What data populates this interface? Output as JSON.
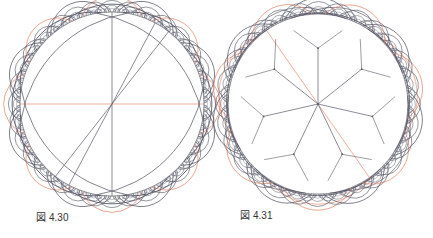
{
  "colors": {
    "background": "#ffffff",
    "geodesic": "#5a5a6a",
    "highlight": "#e98b6e",
    "boundary": "#9a9aa2",
    "caption": "#333333"
  },
  "figures": [
    {
      "id": "fig-4-30",
      "caption_prefix": "図",
      "caption_number": "4.30",
      "caption_pos": [
        36,
        209
      ],
      "disk": {
        "cx": 112,
        "cy": 104,
        "r": 92
      },
      "center_lines": [
        {
          "angle_deg": 90,
          "color": "geodesic"
        },
        {
          "angle_deg": 0,
          "color": "highlight"
        },
        {
          "angle_deg": 52,
          "color": "geodesic"
        },
        {
          "angle_deg": 62,
          "color": "geodesic"
        }
      ],
      "boundary_ring": {
        "count": 4,
        "start_deg": 45,
        "levels": 3,
        "highlight_every": 2
      }
    },
    {
      "id": "fig-4-31",
      "caption_prefix": "図",
      "caption_number": "4.31",
      "caption_pos": [
        240,
        207
      ],
      "disk": {
        "cx": 318,
        "cy": 104,
        "r": 90
      },
      "center_lines": [],
      "rays": {
        "count": 7,
        "start_deg": 90,
        "inner_frac": 0.62,
        "color": "geodesic"
      },
      "highlight_diameter_deg": -55,
      "boundary_ring": {
        "count": 7,
        "start_deg": 64,
        "levels": 3,
        "highlight_every": 2
      }
    }
  ]
}
